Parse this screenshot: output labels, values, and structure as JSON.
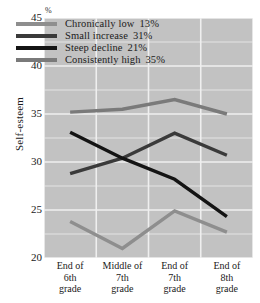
{
  "chart_data": {
    "type": "line",
    "title": "",
    "xlabel": "",
    "ylabel": "Self-esteem",
    "unit_label": "%",
    "categories": [
      "End of 6th grade",
      "Middle of 7th grade",
      "End of 7th grade",
      "End of 8th grade"
    ],
    "category_lines": [
      [
        "End of",
        "6th",
        "grade"
      ],
      [
        "Middle of",
        "7th",
        "grade"
      ],
      [
        "End of",
        "7th",
        "grade"
      ],
      [
        "End of",
        "8th",
        "grade"
      ]
    ],
    "ylim": [
      20,
      45
    ],
    "yticks": [
      45,
      40,
      35,
      30,
      25,
      20
    ],
    "grid": true,
    "legend_position": "top-center",
    "series": [
      {
        "name": "Chronically low",
        "share": "13%",
        "color": "#8e8e8e",
        "values": [
          23.8,
          21.0,
          24.9,
          22.7
        ]
      },
      {
        "name": "Small increase",
        "share": "31%",
        "color": "#3a3a3a",
        "values": [
          28.8,
          30.4,
          33.0,
          30.7
        ]
      },
      {
        "name": "Steep decline",
        "share": "21%",
        "color": "#141414",
        "values": [
          33.1,
          30.4,
          28.2,
          24.3
        ]
      },
      {
        "name": "Consistently high",
        "share": "35%",
        "color": "#7a7a7a",
        "values": [
          35.2,
          35.5,
          36.5,
          35.0
        ]
      }
    ]
  },
  "legend": {
    "entries": [
      {
        "label": "Chronically low",
        "value": "13%"
      },
      {
        "label": "Small increase",
        "value": "31%"
      },
      {
        "label": "Steep decline",
        "value": "21%"
      },
      {
        "label": "Consistently high",
        "value": "35%"
      }
    ]
  },
  "axes": {
    "y_title": "Self-esteem",
    "y_unit": "%",
    "y_ticks": [
      "45",
      "40",
      "35",
      "30",
      "25",
      "20"
    ]
  },
  "colors": {
    "plot_background": "#c2c2c2",
    "gridline": "#efefef",
    "text": "#1a1a1a"
  }
}
